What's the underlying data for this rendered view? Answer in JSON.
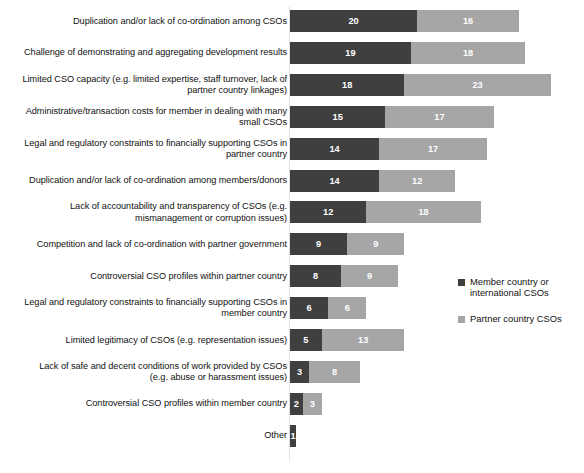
{
  "chart_data": {
    "type": "bar",
    "orientation": "horizontal",
    "stacked": true,
    "title": "",
    "subtitle": "",
    "xlabel": "",
    "ylabel": "",
    "grid": false,
    "legend_position": "right",
    "xlim": [
      0,
      41
    ],
    "categories": [
      "Duplication and/or lack of co-ordination among CSOs",
      "Challenge of demonstrating and aggregating development results",
      "Limited CSO capacity (e.g. limited expertise, staff turnover, lack of partner country linkages)",
      "Administrative/transaction costs for member in dealing with many small CSOs",
      "Legal and regulatory constraints to financially supporting CSOs in partner country",
      "Duplication and/or lack of co-ordination among members/donors",
      "Lack of accountability and transparency of CSOs (e.g. mismanagement or corruption issues)",
      "Competition and lack of co-ordination with partner government",
      "Controversial CSO profiles within partner country",
      "Legal and regulatory constraints to financially supporting CSOs in member country",
      "Limited legitimacy of CSOs (e.g. representation issues)",
      "Lack of safe and decent conditions of work provided by CSOs (e.g. abuse or harassment issues)",
      "Controversial CSO profiles within member country",
      "Other"
    ],
    "series": [
      {
        "name": "Member country or international CSOs",
        "color": "#3f3f3f",
        "values": [
          20,
          19,
          18,
          15,
          14,
          14,
          12,
          9,
          8,
          6,
          5,
          3,
          2,
          1
        ]
      },
      {
        "name": "Partner country CSOs",
        "color": "#a6a6a6",
        "values": [
          16,
          18,
          23,
          17,
          17,
          12,
          18,
          9,
          9,
          6,
          13,
          8,
          3,
          0
        ]
      }
    ],
    "totals": [
      36,
      37,
      41,
      32,
      31,
      26,
      30,
      18,
      17,
      12,
      18,
      11,
      5,
      1
    ]
  },
  "legend": {
    "items": [
      {
        "label": "Member country or international CSOs",
        "color": "#3f3f3f",
        "swatch": "square-marker-icon"
      },
      {
        "label": "Partner country CSOs",
        "color": "#a6a6a6",
        "swatch": "square-marker-icon"
      }
    ]
  }
}
